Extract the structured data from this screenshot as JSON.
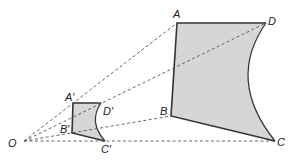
{
  "diagram": {
    "colors": {
      "fill": "#d6d6d6",
      "edge": "#333333",
      "dashed": "#555555"
    },
    "labels": {
      "O": "O",
      "A": "A",
      "B": "B",
      "C": "C",
      "D": "D",
      "A1": "A′",
      "B1": "B′",
      "C1": "C′",
      "D1": "D′"
    },
    "points": {
      "O": [
        24,
        141
      ],
      "A": [
        177,
        23
      ],
      "B": [
        171,
        116
      ],
      "C": [
        275,
        141
      ],
      "D": [
        266,
        23
      ],
      "A1": [
        73,
        103
      ],
      "B1": [
        72,
        133
      ],
      "C1": [
        105,
        141
      ],
      "D1": [
        101,
        103
      ]
    }
  }
}
